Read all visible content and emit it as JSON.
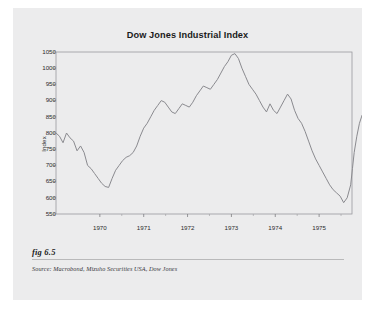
{
  "figure": {
    "fig_label": "fig 6.5",
    "source": "Source:  Macrobond, Mizuho Securities USA, Dow Jones"
  },
  "chart_data": {
    "type": "line",
    "title": "Dow Jones Industrial Index",
    "xlabel": "",
    "ylabel": "Index",
    "grid": false,
    "legend": false,
    "xlim": [
      1969.0,
      1975.75
    ],
    "ylim": [
      550,
      1050
    ],
    "yticks": [
      550,
      600,
      650,
      700,
      750,
      800,
      850,
      900,
      950,
      1000,
      1050
    ],
    "ytick_labels": [
      "550",
      "600",
      "650",
      "700",
      "750",
      "800",
      "850",
      "900",
      "950",
      "1000",
      "1050"
    ],
    "xticks": [
      1970,
      1971,
      1972,
      1973,
      1974,
      1975
    ],
    "xtick_labels": [
      "1970",
      "1971",
      "1972",
      "1973",
      "1974",
      "1975"
    ],
    "line_color": "#8a8a8f",
    "series": [
      {
        "name": "Dow Jones Industrial Index",
        "x": [
          1969.0,
          1969.08,
          1969.16,
          1969.24,
          1969.32,
          1969.4,
          1969.48,
          1969.56,
          1969.64,
          1969.72,
          1969.8,
          1969.88,
          1969.96,
          1970.04,
          1970.12,
          1970.2,
          1970.28,
          1970.36,
          1970.44,
          1970.52,
          1970.6,
          1970.68,
          1970.76,
          1970.84,
          1970.92,
          1971.0,
          1971.08,
          1971.16,
          1971.24,
          1971.32,
          1971.4,
          1971.48,
          1971.56,
          1971.64,
          1971.72,
          1971.8,
          1971.88,
          1971.96,
          1972.04,
          1972.12,
          1972.2,
          1972.28,
          1972.36,
          1972.44,
          1972.52,
          1972.6,
          1972.68,
          1972.76,
          1972.84,
          1972.92,
          1973.0,
          1973.08,
          1973.16,
          1973.24,
          1973.32,
          1973.4,
          1973.48,
          1973.56,
          1973.64,
          1973.72,
          1973.8,
          1973.88,
          1973.96,
          1974.04,
          1974.12,
          1974.2,
          1974.28,
          1974.36,
          1974.44,
          1974.52,
          1974.6,
          1974.68,
          1974.76,
          1974.84,
          1974.92,
          1975.0,
          1975.08,
          1975.16,
          1975.24,
          1975.32,
          1975.4,
          1975.48,
          1975.56,
          1975.64,
          1975.72
        ],
        "y": [
          800,
          790,
          770,
          800,
          785,
          775,
          745,
          760,
          740,
          700,
          690,
          675,
          660,
          645,
          635,
          632,
          660,
          685,
          700,
          715,
          725,
          730,
          740,
          760,
          790,
          815,
          830,
          850,
          870,
          885,
          900,
          895,
          880,
          865,
          860,
          875,
          890,
          885,
          880,
          895,
          915,
          930,
          945,
          940,
          935,
          950,
          965,
          985,
          1005,
          1020,
          1040,
          1045,
          1030,
          1000,
          975,
          950,
          935,
          920,
          900,
          880,
          865,
          890,
          870,
          860,
          880,
          900,
          920,
          905,
          870,
          845,
          830,
          805,
          775,
          745,
          720,
          700,
          680,
          660,
          640,
          625,
          615,
          605,
          585,
          600,
          640
        ]
      }
    ],
    "series_continuation": {
      "note": "x/y arrays above are continued by the tail segment below",
      "x": [
        1975.76,
        1975.8,
        1975.86,
        1975.92,
        1975.98,
        1976.04,
        1976.1,
        1976.16,
        1976.22,
        1976.28,
        1976.34,
        1976.4
      ],
      "y": [
        690,
        740,
        790,
        830,
        855,
        845,
        820,
        810,
        830,
        845,
        848,
        850
      ]
    },
    "annotations": [
      {
        "label": "1970 low",
        "value": 632
      },
      {
        "label": "1973 peak",
        "value": 1045
      },
      {
        "label": "1974 low",
        "value": 585
      },
      {
        "label": "1975 level",
        "value": 850
      }
    ]
  }
}
